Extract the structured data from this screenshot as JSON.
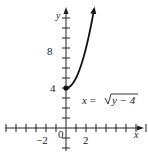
{
  "chart_data": {
    "type": "line",
    "title": "",
    "equation": "x = √(y − 4)",
    "equation_parts": {
      "lhs": "x = ",
      "radicand": "y − 4"
    },
    "xlabel": "x",
    "ylabel": "y",
    "x_tick_labels": [
      "−2",
      "0",
      "2"
    ],
    "y_tick_labels": [
      "4",
      "8"
    ],
    "xlim": [
      -6,
      11
    ],
    "ylim": [
      -3,
      12.5
    ],
    "grid": false,
    "series": [
      {
        "name": "x = √(y − 4)",
        "x": [
          0,
          0.5,
          1,
          1.5,
          2,
          2.5,
          2.8
        ],
        "y": [
          4,
          4.25,
          5,
          6.25,
          8,
          10.25,
          11.84
        ],
        "start_point": {
          "x": 0,
          "y": 4,
          "filled": true
        },
        "end": "arrow"
      }
    ]
  }
}
